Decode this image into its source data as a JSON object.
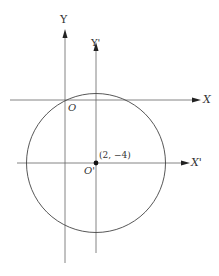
{
  "diagram": {
    "type": "coordinate-translation",
    "labels": {
      "y_axis": "Y",
      "y_prime_axis": "Y'",
      "x_axis": "X",
      "x_prime_axis": "X'",
      "origin": "O",
      "new_origin": "O'",
      "center_point": "(2, −4)"
    },
    "circle": {
      "center": [
        2,
        -4
      ],
      "note": "circle centered at O' passing near O"
    },
    "colors": {
      "line": "#555555",
      "circle": "#444444",
      "point": "#111111",
      "text": "#333333"
    }
  }
}
